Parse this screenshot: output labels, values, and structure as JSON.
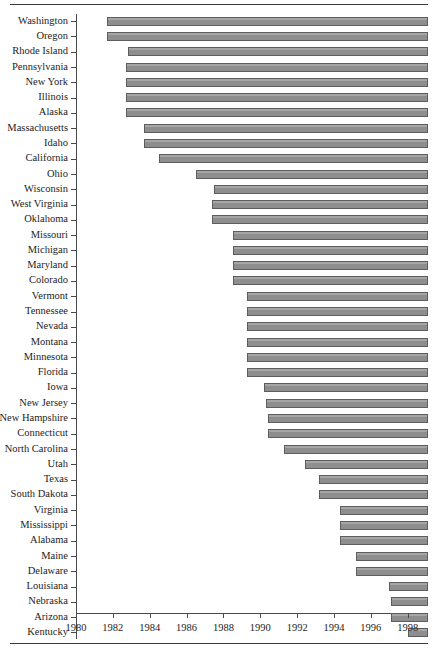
{
  "figure": {
    "top_rule": true,
    "bottom_rule": true
  },
  "chart_data": {
    "type": "bar",
    "orientation": "horizontal",
    "subtype": "range-bar",
    "title": "",
    "subtitle": "",
    "xlabel": "",
    "ylabel": "",
    "xlim": [
      1980,
      1999.1
    ],
    "grid": false,
    "legend": null,
    "bar_color": "#8e8e8e",
    "bar_edge_color": "#5d5d5d",
    "xticks": [
      1980,
      1982,
      1984,
      1986,
      1988,
      1990,
      1992,
      1994,
      1996,
      1998
    ],
    "xtick_labels": [
      "1980",
      "1982",
      "1984",
      "1986",
      "1988",
      "1990",
      "1992",
      "1994",
      "1996",
      "1998"
    ],
    "categories": [
      "Washington",
      "Oregon",
      "Rhode Island",
      "Pennsylvania",
      "New York",
      "Illinois",
      "Alaska",
      "Massachusetts",
      "Idaho",
      "California",
      "Ohio",
      "Wisconsin",
      "West Virginia",
      "Oklahoma",
      "Missouri",
      "Michigan",
      "Maryland",
      "Colorado",
      "Vermont",
      "Tennessee",
      "Nevada",
      "Montana",
      "Minnesota",
      "Florida",
      "Iowa",
      "New Jersey",
      "New Hampshire",
      "Connecticut",
      "North Carolina",
      "Utah",
      "Texas",
      "South Dakota",
      "Virginia",
      "Mississippi",
      "Alabama",
      "Maine",
      "Delaware",
      "Louisiana",
      "Nebraska",
      "Arizona",
      "Kentucky"
    ],
    "bars": [
      {
        "label": "Washington",
        "start": 1981.7,
        "end": 1999.1
      },
      {
        "label": "Oregon",
        "start": 1981.7,
        "end": 1999.1
      },
      {
        "label": "Rhode Island",
        "start": 1982.8,
        "end": 1999.1
      },
      {
        "label": "Pennsylvania",
        "start": 1982.7,
        "end": 1999.1
      },
      {
        "label": "New York",
        "start": 1982.7,
        "end": 1999.1
      },
      {
        "label": "Illinois",
        "start": 1982.7,
        "end": 1999.1
      },
      {
        "label": "Alaska",
        "start": 1982.7,
        "end": 1999.1
      },
      {
        "label": "Massachusetts",
        "start": 1983.7,
        "end": 1999.1
      },
      {
        "label": "Idaho",
        "start": 1983.7,
        "end": 1999.1
      },
      {
        "label": "California",
        "start": 1984.5,
        "end": 1999.1
      },
      {
        "label": "Ohio",
        "start": 1986.5,
        "end": 1999.1
      },
      {
        "label": "Wisconsin",
        "start": 1987.5,
        "end": 1999.1
      },
      {
        "label": "West Virginia",
        "start": 1987.4,
        "end": 1999.1
      },
      {
        "label": "Oklahoma",
        "start": 1987.4,
        "end": 1999.1
      },
      {
        "label": "Missouri",
        "start": 1988.5,
        "end": 1999.1
      },
      {
        "label": "Michigan",
        "start": 1988.5,
        "end": 1999.1
      },
      {
        "label": "Maryland",
        "start": 1988.5,
        "end": 1999.1
      },
      {
        "label": "Colorado",
        "start": 1988.5,
        "end": 1999.1
      },
      {
        "label": "Vermont",
        "start": 1989.3,
        "end": 1999.1
      },
      {
        "label": "Tennessee",
        "start": 1989.3,
        "end": 1999.1
      },
      {
        "label": "Nevada",
        "start": 1989.3,
        "end": 1999.1
      },
      {
        "label": "Montana",
        "start": 1989.3,
        "end": 1999.1
      },
      {
        "label": "Minnesota",
        "start": 1989.3,
        "end": 1999.1
      },
      {
        "label": "Florida",
        "start": 1989.3,
        "end": 1999.1
      },
      {
        "label": "Iowa",
        "start": 1990.2,
        "end": 1999.1
      },
      {
        "label": "New Jersey",
        "start": 1990.3,
        "end": 1999.1
      },
      {
        "label": "New Hampshire",
        "start": 1990.4,
        "end": 1999.1
      },
      {
        "label": "Connecticut",
        "start": 1990.4,
        "end": 1999.1
      },
      {
        "label": "North Carolina",
        "start": 1991.3,
        "end": 1999.1
      },
      {
        "label": "Utah",
        "start": 1992.4,
        "end": 1999.1
      },
      {
        "label": "Texas",
        "start": 1993.2,
        "end": 1999.1
      },
      {
        "label": "South Dakota",
        "start": 1993.2,
        "end": 1999.1
      },
      {
        "label": "Virginia",
        "start": 1994.3,
        "end": 1999.1
      },
      {
        "label": "Mississippi",
        "start": 1994.3,
        "end": 1999.1
      },
      {
        "label": "Alabama",
        "start": 1994.3,
        "end": 1999.1
      },
      {
        "label": "Maine",
        "start": 1995.2,
        "end": 1999.1
      },
      {
        "label": "Delaware",
        "start": 1995.2,
        "end": 1999.1
      },
      {
        "label": "Louisiana",
        "start": 1997.0,
        "end": 1999.1
      },
      {
        "label": "Nebraska",
        "start": 1997.1,
        "end": 1999.1
      },
      {
        "label": "Arizona",
        "start": 1997.1,
        "end": 1999.1
      },
      {
        "label": "Kentucky",
        "start": 1998.0,
        "end": 1999.1
      }
    ]
  }
}
